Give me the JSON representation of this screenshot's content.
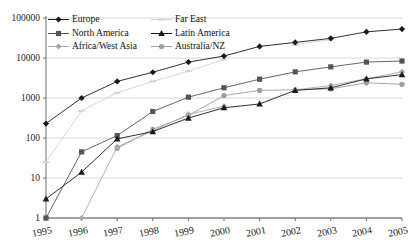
{
  "chart_data": {
    "type": "line",
    "title": "",
    "xlabel": "",
    "ylabel": "",
    "yscale": "log",
    "ylim": [
      1,
      100000
    ],
    "grid": true,
    "legend_position": "top-left",
    "categories": [
      "1995",
      "1996",
      "1997",
      "1998",
      "1999",
      "2000",
      "2001",
      "2002",
      "2003",
      "2004",
      "2005"
    ],
    "ytick_labels": [
      "1",
      "10",
      "100",
      "1000",
      "10000",
      "100000"
    ],
    "ytick_values": [
      1,
      10,
      100,
      1000,
      10000,
      100000
    ],
    "series": [
      {
        "name": "Europe",
        "color": "#1a1a1a",
        "marker": "diamond",
        "values": [
          230,
          1000,
          2600,
          4400,
          7900,
          11200,
          19500,
          24500,
          31000,
          45000,
          53000
        ]
      },
      {
        "name": "North America",
        "color": "#555555",
        "marker": "square",
        "values": [
          1,
          45,
          115,
          460,
          1050,
          1800,
          2950,
          4500,
          6000,
          7900,
          8400
        ]
      },
      {
        "name": "Africa/West Asia",
        "color": "#a8a8a8",
        "marker": "diamond",
        "values": [
          null,
          1,
          60,
          150,
          390,
          620,
          null,
          1600,
          2050,
          3050,
          4500
        ]
      },
      {
        "name": "Far East",
        "color": "#d2d2d2",
        "marker": "dash",
        "values": [
          25,
          480,
          1350,
          2600,
          4700,
          9200,
          null,
          21500,
          29000,
          null,
          null
        ]
      },
      {
        "name": "Latin America",
        "color": "#1a1a1a",
        "marker": "triangle",
        "values": [
          3,
          14,
          95,
          145,
          315,
          570,
          710,
          1550,
          1800,
          3000,
          3850
        ]
      },
      {
        "name": "Australia/NZ",
        "color": "#9d9d9d",
        "marker": "circle",
        "values": [
          null,
          null,
          55,
          165,
          365,
          1150,
          1550,
          1600,
          1700,
          2400,
          2200
        ]
      }
    ]
  },
  "legend": {
    "entries": [
      {
        "label": "Europe"
      },
      {
        "label": "Far East"
      },
      {
        "label": "North America"
      },
      {
        "label": "Latin America"
      },
      {
        "label": "Africa/West Asia"
      },
      {
        "label": "Australia/NZ"
      }
    ]
  }
}
